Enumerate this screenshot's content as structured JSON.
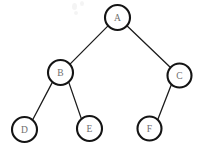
{
  "diagram": {
    "type": "binary-tree",
    "canvas": {
      "width": 205,
      "height": 158,
      "background": "#ffffff"
    },
    "style": {
      "node_fill": "#ffffff",
      "node_stroke": "#141414",
      "node_stroke_width": 2.1,
      "edge_stroke": "#1c1c1c",
      "edge_stroke_width": 1.3,
      "label_color": "#6e6e6e"
    },
    "nodes": [
      {
        "id": "A",
        "label": "A",
        "cx": 117.5,
        "cy": 17.5,
        "r": 12.5,
        "level": 0
      },
      {
        "id": "B",
        "label": "B",
        "cx": 60.5,
        "cy": 72.5,
        "r": 12.5,
        "level": 1
      },
      {
        "id": "C",
        "label": "C",
        "cx": 179.5,
        "cy": 75.5,
        "r": 12.0,
        "level": 1
      },
      {
        "id": "D",
        "label": "D",
        "cx": 24.5,
        "cy": 129.5,
        "r": 12.5,
        "level": 2
      },
      {
        "id": "E",
        "label": "E",
        "cx": 89.5,
        "cy": 128.5,
        "r": 12.5,
        "level": 2
      },
      {
        "id": "F",
        "label": "F",
        "cx": 149.5,
        "cy": 128.5,
        "r": 12.0,
        "level": 2
      }
    ],
    "edges": [
      {
        "id": "A-B",
        "from": "A",
        "to": "B",
        "x1": 108.0,
        "y1": 25.9,
        "x2": 70.0,
        "y2": 64.1
      },
      {
        "id": "A-C",
        "from": "A",
        "to": "C",
        "x1": 126.9,
        "y1": 25.7,
        "x2": 170.5,
        "y2": 67.5
      },
      {
        "id": "B-D",
        "from": "B",
        "to": "D",
        "x1": 52.3,
        "y1": 82.4,
        "x2": 32.7,
        "y2": 119.8
      },
      {
        "id": "B-E",
        "from": "B",
        "to": "E",
        "x1": 68.8,
        "y1": 82.4,
        "x2": 81.3,
        "y2": 118.6
      },
      {
        "id": "C-F",
        "from": "C",
        "to": "F",
        "x1": 171.2,
        "y1": 84.9,
        "x2": 157.9,
        "y2": 119.3
      }
    ],
    "artifacts": [
      {
        "id": "smudge-a",
        "kind": "scan-smudge"
      },
      {
        "id": "smudge-b",
        "kind": "scan-smudge"
      },
      {
        "id": "smudge-c",
        "kind": "scan-smudge"
      }
    ]
  }
}
